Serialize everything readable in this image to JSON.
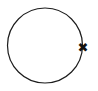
{
  "figure": {
    "width": 98,
    "height": 91,
    "background_color": "#ffffff",
    "stroke_color": "#1c1c1c",
    "marker_color": "#121212"
  },
  "shapes": {
    "circle": {
      "name": "circle-outline",
      "center_x": 45,
      "center_y": 45.5,
      "radius": 37.5,
      "stroke_width": 1.2,
      "fill": "none"
    },
    "marker": {
      "name": "x-marker",
      "glyph": "✖",
      "label": "x-mark",
      "center_x": 83,
      "center_y": 47,
      "size": 13
    }
  },
  "chart_data": {
    "type": "scatter",
    "title": "",
    "xlabel": "",
    "ylabel": "",
    "xlim": [
      0,
      98
    ],
    "ylim": [
      0,
      91
    ],
    "grid": false,
    "legend": "none",
    "annotations": [
      {
        "kind": "circle",
        "cx": 45,
        "cy": 45.5,
        "r": 37.5,
        "stroke": "#1c1c1c",
        "fill": "none"
      },
      {
        "kind": "marker",
        "marker": "x",
        "x": 83,
        "y": 47,
        "color": "#121212",
        "text": "✖"
      }
    ],
    "series": [
      {
        "name": "x-point",
        "x": [
          83
        ],
        "y": [
          47
        ],
        "marker": "x"
      }
    ]
  }
}
